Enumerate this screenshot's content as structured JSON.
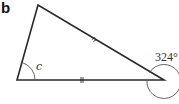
{
  "panel": {
    "label": "b"
  },
  "diagram": {
    "type": "triangle",
    "vertices": {
      "top": [
        38,
        5
      ],
      "bottom_left": [
        17,
        80
      ],
      "bottom_right": [
        164,
        80
      ]
    },
    "equal_side_marks": [
      "top-to-bottom_right",
      "bottom_left-to-bottom_right"
    ],
    "interior_angle": {
      "vertex": "bottom_left",
      "label": "c"
    },
    "reflex_angle": {
      "vertex": "bottom_right",
      "label": "324°"
    },
    "colors": {
      "stroke": "#2a2a2a",
      "arc": "#555555",
      "background": "#ffffff"
    }
  }
}
